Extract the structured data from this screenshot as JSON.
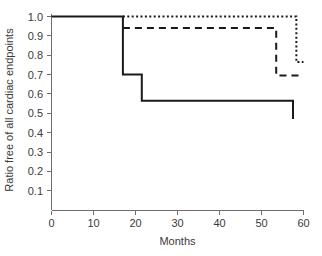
{
  "chart_data": {
    "type": "line",
    "title": "",
    "subtitle": "",
    "xlabel": "Months",
    "ylabel": "Ratio free of all cardiac endpoints",
    "xlim": [
      0,
      60
    ],
    "ylim": [
      0,
      1.05
    ],
    "xticks": [
      0,
      10,
      20,
      30,
      40,
      50,
      60
    ],
    "xtick_labels": [
      "0",
      "10",
      "20",
      "30",
      "40",
      "50",
      "60"
    ],
    "yticks": [
      0.1,
      0.2,
      0.3,
      0.4,
      0.5,
      0.6,
      0.7,
      0.8,
      0.9,
      1.0
    ],
    "ytick_labels": [
      "0.1",
      "0.2",
      "0.3",
      "0.4",
      "0.5",
      "0.6",
      "0.7",
      "0.8",
      "0.9",
      "1.0"
    ],
    "grid": false,
    "legend": "none",
    "annotations": [],
    "series": [
      {
        "name": "solid-curve",
        "style": "solid",
        "color": "#1a1a1a",
        "step": "post",
        "x": [
          0,
          17,
          17,
          17,
          21.5,
          21.5,
          57.5,
          57.5
        ],
        "y": [
          1.0,
          1.0,
          0.94,
          0.7,
          0.7,
          0.565,
          0.565,
          0.47
        ],
        "steps": [
          {
            "month": 0,
            "ratio": 1.0
          },
          {
            "month": 17,
            "ratio": 0.94
          },
          {
            "month": 17,
            "ratio": 0.7
          },
          {
            "month": 21.5,
            "ratio": 0.565
          },
          {
            "month": 57.5,
            "ratio": 0.47
          }
        ]
      },
      {
        "name": "dashed-curve",
        "style": "dashed",
        "color": "#1a1a1a",
        "step": "post",
        "x": [
          17,
          53.5,
          53.5,
          60
        ],
        "y": [
          0.94,
          0.94,
          0.695,
          0.695
        ],
        "steps": [
          {
            "month": 17,
            "ratio": 0.94
          },
          {
            "month": 53.5,
            "ratio": 0.695
          },
          {
            "month": 60,
            "ratio": 0.695
          }
        ]
      },
      {
        "name": "dotted-curve",
        "style": "dotted",
        "color": "#1a1a1a",
        "step": "post",
        "x": [
          17,
          58.3,
          58.3,
          60
        ],
        "y": [
          1.0,
          1.0,
          0.765,
          0.765
        ],
        "steps": [
          {
            "month": 17,
            "ratio": 1.0
          },
          {
            "month": 58.3,
            "ratio": 0.765
          },
          {
            "month": 60,
            "ratio": 0.765
          }
        ]
      }
    ]
  }
}
